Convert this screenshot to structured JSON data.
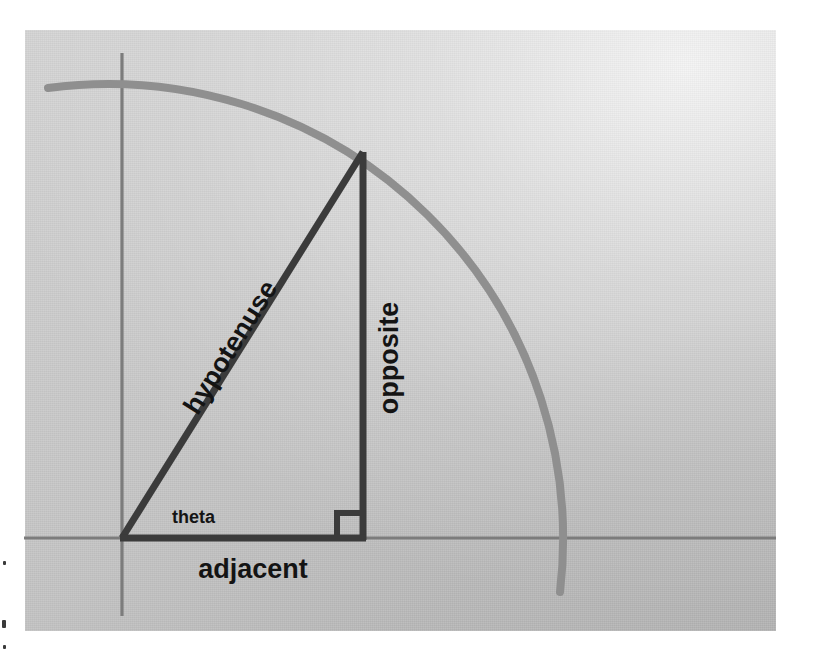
{
  "figure": {
    "background_color": "#c6c6c6",
    "panel": {
      "x": 25,
      "y": 30,
      "width": 751,
      "height": 601
    }
  },
  "axes": {
    "horizontal": {
      "name": "x-axis",
      "color": "#7c7c7c",
      "x1": 24,
      "y1": 538,
      "x2": 776,
      "y2": 538,
      "stroke_width": 3
    },
    "vertical": {
      "name": "y-axis",
      "color": "#7c7c7c",
      "x1": 122,
      "y1": 53,
      "x2": 122,
      "y2": 616,
      "stroke_width": 3
    }
  },
  "arc": {
    "name": "unit-circle-arc",
    "color": "#8f8f8f",
    "stroke_width": 8,
    "center_x": 122,
    "center_y": 538,
    "radius": 455,
    "start_x": 48,
    "start_y": 88,
    "end_x": 560,
    "end_y": 592,
    "description": "quarter circle arc through the triangle apex"
  },
  "triangle": {
    "name": "right-triangle",
    "color": "#3b3b3b",
    "stroke_width": 7,
    "vertices": {
      "origin": {
        "x": 122,
        "y": 538
      },
      "apex": {
        "x": 363,
        "y": 152
      },
      "foot": {
        "x": 363,
        "y": 538
      }
    },
    "right_angle_marker": {
      "name": "right-angle-marker",
      "x": 334,
      "y": 509,
      "size": 22
    }
  },
  "labels": {
    "hypotenuse": {
      "text": "hypotenuse",
      "x": 238,
      "y": 352,
      "rotation": -58,
      "size": "large"
    },
    "opposite": {
      "text": "opposite",
      "x": 398,
      "y": 358,
      "rotation": -90,
      "size": "large"
    },
    "adjacent": {
      "text": "adjacent",
      "x": 253,
      "y": 578,
      "rotation": 0,
      "size": "large"
    },
    "theta": {
      "text": "theta",
      "x": 172,
      "y": 523,
      "rotation": 0,
      "size": "small"
    }
  },
  "artifacts": {
    "edge_specks": [
      {
        "x": 3,
        "y": 561,
        "w": 3,
        "h": 4
      },
      {
        "x": 2,
        "y": 620,
        "w": 4,
        "h": 8
      },
      {
        "x": 3,
        "y": 645,
        "w": 3,
        "h": 4
      }
    ]
  }
}
